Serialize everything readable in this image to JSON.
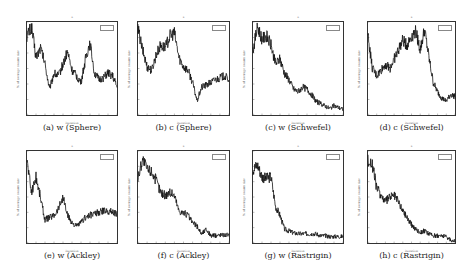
{
  "figure": {
    "panels": [
      {
        "id": "a",
        "caption": "(a) w (Sphere)",
        "left": 26,
        "top": 21,
        "w": 92,
        "h": 95
      },
      {
        "id": "b",
        "caption": "(b) c (Sphere)",
        "left": 137,
        "top": 21,
        "w": 93,
        "h": 95
      },
      {
        "id": "c",
        "caption": "(c) w (Schwefel)",
        "left": 252,
        "top": 21,
        "w": 92,
        "h": 95
      },
      {
        "id": "d",
        "caption": "(d) c (Schwefel)",
        "left": 367,
        "top": 21,
        "w": 89,
        "h": 95
      },
      {
        "id": "e",
        "caption": "(e) w (Ackley)",
        "left": 26,
        "top": 150,
        "w": 92,
        "h": 94
      },
      {
        "id": "f",
        "caption": "(f) c (Ackley)",
        "left": 137,
        "top": 150,
        "w": 93,
        "h": 94
      },
      {
        "id": "g",
        "caption": "(g) w (Rastrigin)",
        "left": 252,
        "top": 150,
        "w": 92,
        "h": 94
      },
      {
        "id": "h",
        "caption": "(h) c (Rastrigin)",
        "left": 367,
        "top": 150,
        "w": 89,
        "h": 94
      }
    ],
    "xlabel": "iteration",
    "ylabel": "% of average swarm size"
  },
  "chart_data": [
    {
      "type": "line",
      "title": "(a) w (Sphere)",
      "xlabel": "iteration",
      "ylabel": "% of average swarm size",
      "xlim": [
        0,
        500
      ],
      "x": [
        0,
        25,
        50,
        75,
        100,
        125,
        150,
        175,
        200,
        225,
        250,
        275,
        300,
        325,
        350,
        375,
        400,
        425,
        450,
        475,
        500
      ],
      "values": [
        0.85,
        0.95,
        0.62,
        0.72,
        0.55,
        0.28,
        0.45,
        0.42,
        0.55,
        0.68,
        0.48,
        0.42,
        0.35,
        0.6,
        0.78,
        0.45,
        0.38,
        0.4,
        0.45,
        0.42,
        0.3
      ]
    },
    {
      "type": "line",
      "title": "(b) c (Sphere)",
      "xlabel": "iteration",
      "ylabel": "% of average swarm size",
      "xlim": [
        0,
        500
      ],
      "x": [
        0,
        25,
        50,
        75,
        100,
        125,
        150,
        175,
        200,
        225,
        250,
        275,
        300,
        325,
        350,
        375,
        400,
        425,
        450,
        475,
        500
      ],
      "values": [
        0.92,
        0.7,
        0.52,
        0.48,
        0.65,
        0.75,
        0.72,
        0.85,
        0.88,
        0.62,
        0.52,
        0.48,
        0.35,
        0.15,
        0.3,
        0.32,
        0.35,
        0.38,
        0.4,
        0.42,
        0.38
      ]
    },
    {
      "type": "line",
      "title": "(c) w (Schwefel)",
      "xlabel": "iteration",
      "ylabel": "% of average swarm size",
      "xlim": [
        0,
        500
      ],
      "x": [
        0,
        25,
        50,
        75,
        100,
        125,
        150,
        175,
        200,
        225,
        250,
        275,
        300,
        325,
        350,
        375,
        400,
        425,
        450,
        475,
        500
      ],
      "values": [
        0.7,
        0.95,
        0.82,
        0.85,
        0.75,
        0.55,
        0.6,
        0.45,
        0.38,
        0.28,
        0.25,
        0.3,
        0.28,
        0.22,
        0.15,
        0.12,
        0.1,
        0.07,
        0.1,
        0.08,
        0.06
      ]
    },
    {
      "type": "line",
      "title": "(d) c (Schwefel)",
      "xlabel": "iteration",
      "ylabel": "% of average swarm size",
      "xlim": [
        0,
        500
      ],
      "x": [
        0,
        25,
        50,
        75,
        100,
        125,
        150,
        175,
        200,
        225,
        250,
        275,
        300,
        325,
        350,
        375,
        400,
        425,
        450,
        475,
        500
      ],
      "values": [
        0.85,
        0.5,
        0.42,
        0.48,
        0.55,
        0.5,
        0.6,
        0.7,
        0.8,
        0.75,
        0.85,
        0.9,
        0.7,
        0.92,
        0.62,
        0.35,
        0.25,
        0.18,
        0.15,
        0.22,
        0.2
      ]
    },
    {
      "type": "line",
      "title": "(e) w (Ackley)",
      "xlabel": "iteration",
      "ylabel": "% of average swarm size",
      "xlim": [
        0,
        500
      ],
      "x": [
        0,
        25,
        50,
        75,
        100,
        125,
        150,
        175,
        200,
        225,
        250,
        275,
        300,
        325,
        350,
        375,
        400,
        425,
        450,
        475,
        500
      ],
      "values": [
        0.9,
        0.55,
        0.72,
        0.5,
        0.25,
        0.28,
        0.3,
        0.38,
        0.5,
        0.3,
        0.22,
        0.18,
        0.22,
        0.28,
        0.3,
        0.32,
        0.33,
        0.35,
        0.35,
        0.34,
        0.32
      ]
    },
    {
      "type": "line",
      "title": "(f) c (Ackley)",
      "xlabel": "iteration",
      "ylabel": "% of average swarm size",
      "xlim": [
        0,
        500
      ],
      "x": [
        0,
        25,
        50,
        75,
        100,
        125,
        150,
        175,
        200,
        225,
        250,
        275,
        300,
        325,
        350,
        375,
        400,
        425,
        450,
        475,
        500
      ],
      "values": [
        0.7,
        0.92,
        0.8,
        0.78,
        0.68,
        0.55,
        0.52,
        0.55,
        0.52,
        0.35,
        0.33,
        0.3,
        0.22,
        0.18,
        0.1,
        0.15,
        0.08,
        0.08,
        0.09,
        0.09,
        0.09
      ]
    },
    {
      "type": "line",
      "title": "(g) w (Rastrigin)",
      "xlabel": "iteration",
      "ylabel": "% of average swarm size",
      "xlim": [
        0,
        500
      ],
      "x": [
        0,
        25,
        50,
        75,
        100,
        125,
        150,
        175,
        200,
        225,
        250,
        275,
        300,
        325,
        350,
        375,
        400,
        425,
        450,
        475,
        500
      ],
      "values": [
        0.8,
        0.85,
        0.72,
        0.7,
        0.72,
        0.4,
        0.3,
        0.15,
        0.13,
        0.11,
        0.1,
        0.1,
        0.1,
        0.1,
        0.1,
        0.08,
        0.08,
        0.07,
        0.07,
        0.07,
        0.07
      ]
    },
    {
      "type": "line",
      "title": "(h) c (Rastrigin)",
      "xlabel": "iteration",
      "ylabel": "% of average swarm size",
      "xlim": [
        0,
        500
      ],
      "x": [
        0,
        25,
        50,
        75,
        100,
        125,
        150,
        175,
        200,
        225,
        250,
        275,
        300,
        325,
        350,
        375,
        400,
        425,
        450,
        475,
        500
      ],
      "values": [
        0.9,
        0.85,
        0.6,
        0.52,
        0.45,
        0.5,
        0.52,
        0.45,
        0.35,
        0.28,
        0.2,
        0.15,
        0.12,
        0.13,
        0.1,
        0.08,
        0.08,
        0.08,
        0.07,
        0.03,
        0.02
      ]
    }
  ]
}
